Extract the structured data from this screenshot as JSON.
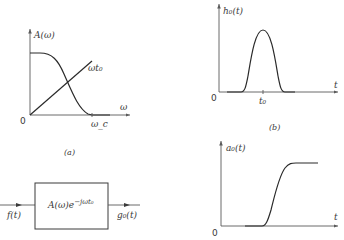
{
  "figure_a": {
    "caption": "(a)",
    "y_label": "A(ω)",
    "x_label": "ω",
    "origin": "0",
    "line_label": "ωt₀",
    "cutoff_label": "ω_c"
  },
  "figure_b": {
    "caption": "(b)",
    "top_plot": {
      "y_label": "h₀(t)",
      "x_label": "t",
      "origin": "0",
      "peak_label": "t₀"
    },
    "bottom_plot": {
      "y_label": "a₀(t)",
      "x_label": "t",
      "origin": "0"
    }
  },
  "block_diagram": {
    "transfer_function": "A(ω)e^{-jωt₀}",
    "block_text": "A(ω)e",
    "block_exponent": "−jωt₀",
    "input_label": "f(t)",
    "output_label": "g₀(t)"
  },
  "colors": {
    "ink": "#2a2a2a",
    "background": "#ffffff"
  }
}
